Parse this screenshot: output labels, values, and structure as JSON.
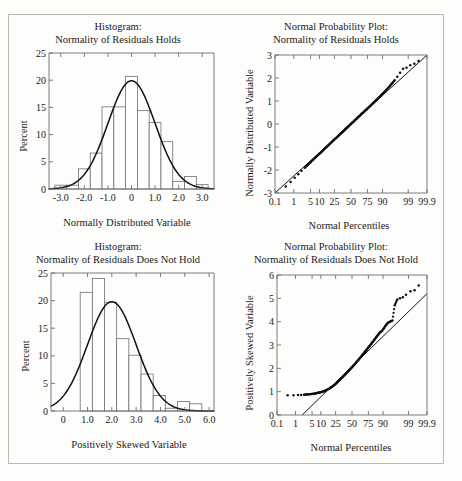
{
  "figure": {
    "panels": [
      {
        "id": "hist-normal",
        "title_line1": "Histogram:",
        "title_line2": "Normality of Residuals Holds",
        "xlabel": "Normally Distributed Variable",
        "ylabel": "Percent"
      },
      {
        "id": "qq-normal",
        "title_line1": "Normal Probability Plot:",
        "title_line2": "Normality of Residuals Holds",
        "xlabel": "Normal Percentiles",
        "ylabel": "Normally Distributed Variable"
      },
      {
        "id": "hist-skewed",
        "title_line1": "Histogram:",
        "title_line2": "Normality of Residuals Does Not Hold",
        "xlabel": "Positively Skewed Variable",
        "ylabel": "Percent"
      },
      {
        "id": "qq-skewed",
        "title_line1": "Normal Probability Plot:",
        "title_line2": "Normality of Residuals Does Not Hold",
        "xlabel": "Normal Percentiles",
        "ylabel": "Positively Skewed Variable"
      }
    ]
  },
  "chart_data": [
    {
      "type": "bar",
      "id": "hist-normal",
      "title": "Histogram: Normality of Residuals Holds",
      "xlabel": "Normally Distributed Variable",
      "ylabel": "Percent",
      "xlim": [
        -3.5,
        3.5
      ],
      "ylim": [
        0,
        25
      ],
      "xticks": [
        -3.0,
        -2.0,
        -1.0,
        0,
        1.0,
        2.0,
        3.0
      ],
      "xticklabels": [
        "-3.0",
        "-2.0",
        "-1.0",
        "0",
        "1.0",
        "2.0",
        "3.0"
      ],
      "yticks": [
        0,
        5,
        10,
        15,
        20,
        25
      ],
      "yticklabels": [
        "0",
        "5",
        "10",
        "15",
        "20",
        "25"
      ],
      "grid": false,
      "bin_edges": [
        -3.25,
        -2.75,
        -2.25,
        -1.75,
        -1.25,
        -0.75,
        -0.25,
        0.25,
        0.75,
        1.25,
        1.75,
        2.25,
        2.75,
        3.25
      ],
      "values": [
        0.7,
        0.7,
        3.7,
        6.6,
        15.1,
        15.1,
        20.7,
        14.4,
        12.2,
        8.7,
        1.4,
        2.3,
        0.8
      ],
      "overlay": {
        "type": "line",
        "name": "normal density curve",
        "mean": 0,
        "sd": 1,
        "peak_percent": 19.9
      }
    },
    {
      "type": "scatter",
      "id": "qq-normal",
      "title": "Normal Probability Plot: Normality of Residuals Holds",
      "xlabel": "Normal Percentiles",
      "ylabel": "Normally Distributed Variable",
      "xscale": "normal-probability",
      "xticks": [
        0.1,
        1,
        5,
        10,
        25,
        50,
        75,
        90,
        99,
        99.9
      ],
      "xticklabels": [
        "0.1",
        "1",
        "5",
        "10",
        "25",
        "50",
        "75",
        "90",
        "99",
        "99.9"
      ],
      "ylim": [
        -3,
        3
      ],
      "yticks": [
        -3,
        -2,
        -1,
        0,
        1,
        2,
        3
      ],
      "yticklabels": [
        "-3",
        "-2",
        "-1",
        "0",
        "1",
        "2",
        "3"
      ],
      "grid": false,
      "reference_line": {
        "from": [
          0.1,
          -3.0
        ],
        "to": [
          99.9,
          3.0
        ]
      },
      "points_percentiles": [
        0.4,
        0.7,
        1.1,
        1.6,
        2.2,
        3.0,
        3.9,
        5.0,
        6.2,
        7.5,
        9.0,
        10.6,
        12.3,
        14.1,
        16.0,
        18.0,
        20.1,
        22.3,
        24.5,
        26.8,
        29.2,
        31.6,
        34.0,
        36.5,
        39.0,
        41.5,
        44.0,
        46.5,
        49.0,
        51.5,
        54.0,
        56.5,
        59.0,
        61.5,
        64.0,
        66.4,
        68.8,
        71.2,
        73.5,
        75.7,
        77.9,
        80.0,
        82.0,
        83.9,
        85.7,
        87.4,
        89.0,
        90.5,
        91.9,
        93.2,
        94.3,
        95.3,
        96.2,
        97.0,
        97.7,
        98.3,
        98.8,
        99.2,
        99.5,
        99.7
      ],
      "points_values": [
        -2.72,
        -2.52,
        -2.34,
        -2.18,
        -2.03,
        -1.9,
        -1.78,
        -1.66,
        -1.55,
        -1.45,
        -1.35,
        -1.26,
        -1.17,
        -1.08,
        -1.0,
        -0.92,
        -0.84,
        -0.76,
        -0.69,
        -0.62,
        -0.55,
        -0.48,
        -0.41,
        -0.35,
        -0.28,
        -0.21,
        -0.15,
        -0.09,
        -0.02,
        0.04,
        0.1,
        0.17,
        0.23,
        0.3,
        0.36,
        0.43,
        0.49,
        0.56,
        0.63,
        0.7,
        0.77,
        0.85,
        0.92,
        1.0,
        1.08,
        1.16,
        1.25,
        1.34,
        1.44,
        1.54,
        1.65,
        1.77,
        1.9,
        2.05,
        2.23,
        2.4,
        2.45,
        2.55,
        2.62,
        2.74
      ],
      "note": "points follow the reference line closely; slight scatter above the line in the upper tail"
    },
    {
      "type": "bar",
      "id": "hist-skewed",
      "title": "Histogram: Normality of Residuals Does Not Hold",
      "xlabel": "Positively Skewed Variable",
      "ylabel": "Percent",
      "xlim": [
        -0.5,
        6.2
      ],
      "ylim": [
        0,
        25
      ],
      "xticks": [
        0,
        1.0,
        2.0,
        3.0,
        4.0,
        5.0,
        6.0
      ],
      "xticklabels": [
        "0",
        "1.0",
        "2.0",
        "3.0",
        "4.0",
        "5.0",
        "6.0"
      ],
      "yticks": [
        0,
        5,
        10,
        15,
        20,
        25
      ],
      "yticklabels": [
        "0",
        "5",
        "10",
        "15",
        "20",
        "25"
      ],
      "grid": false,
      "bin_edges": [
        0.7,
        1.2,
        1.7,
        2.2,
        2.7,
        3.2,
        3.7,
        4.2,
        4.7,
        5.2,
        5.7
      ],
      "values": [
        21.5,
        24.0,
        19.7,
        13.1,
        10.1,
        6.7,
        2.8,
        0.5,
        1.7,
        1.3
      ],
      "overlay": {
        "type": "line",
        "name": "normal density curve",
        "mean": 2.0,
        "sd": 1.0,
        "peak_percent": 19.8
      }
    },
    {
      "type": "scatter",
      "id": "qq-skewed",
      "title": "Normal Probability Plot: Normality of Residuals Does Not Hold",
      "xlabel": "Normal Percentiles",
      "ylabel": "Positively Skewed Variable",
      "xscale": "normal-probability",
      "xticks": [
        0.1,
        1,
        5,
        10,
        25,
        50,
        75,
        90,
        99,
        99.9
      ],
      "xticklabels": [
        "0.1",
        "1",
        "5",
        "10",
        "25",
        "50",
        "75",
        "90",
        "99",
        "99.9"
      ],
      "ylim": [
        0,
        6
      ],
      "yticks": [
        0,
        1,
        2,
        3,
        4,
        5,
        6
      ],
      "yticklabels": [
        "0",
        "1",
        "2",
        "3",
        "4",
        "5",
        "6"
      ],
      "grid": false,
      "reference_line": {
        "from": [
          2.0,
          0.0
        ],
        "to": [
          99.9,
          5.2
        ]
      },
      "points_percentiles": [
        0.4,
        0.8,
        1.3,
        1.8,
        2.4,
        3.1,
        3.9,
        4.8,
        5.8,
        6.9,
        8.1,
        9.4,
        10.8,
        12.3,
        13.9,
        15.6,
        17.4,
        19.3,
        21.3,
        23.4,
        25.6,
        27.9,
        30.2,
        32.6,
        35.0,
        37.5,
        40.0,
        42.5,
        45.0,
        47.5,
        50.0,
        52.5,
        55.0,
        57.5,
        60.0,
        62.5,
        65.0,
        67.4,
        69.8,
        72.1,
        74.4,
        76.6,
        78.7,
        80.7,
        82.6,
        84.4,
        86.1,
        87.7,
        89.2,
        90.6,
        91.9,
        93.1,
        94.2,
        95.2,
        96.1,
        96.9,
        97.6,
        98.2,
        98.7,
        99.2,
        99.5,
        99.7
      ],
      "points_values": [
        0.85,
        0.85,
        0.86,
        0.86,
        0.87,
        0.88,
        0.89,
        0.9,
        0.91,
        0.93,
        0.95,
        0.97,
        0.99,
        1.02,
        1.05,
        1.09,
        1.13,
        1.18,
        1.23,
        1.29,
        1.35,
        1.42,
        1.49,
        1.56,
        1.63,
        1.7,
        1.77,
        1.84,
        1.91,
        1.98,
        2.05,
        2.12,
        2.19,
        2.27,
        2.35,
        2.43,
        2.51,
        2.6,
        2.69,
        2.78,
        2.87,
        2.96,
        3.05,
        3.15,
        3.25,
        3.35,
        3.45,
        3.55,
        3.6,
        3.72,
        3.85,
        3.95,
        4.0,
        4.05,
        4.7,
        4.95,
        5.0,
        5.05,
        5.15,
        5.3,
        5.35,
        5.55
      ],
      "note": "points form a convex curve above the reference line; flat floor near 0.85 in the lower tail and strong upward departure in the upper tail"
    }
  ]
}
